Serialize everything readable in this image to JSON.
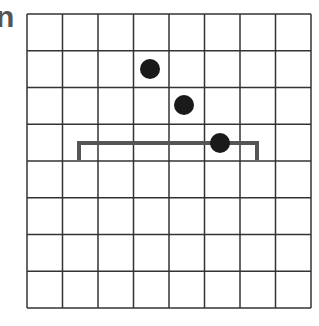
{
  "label": "n",
  "grid": {
    "rows": 8,
    "cols": 8,
    "x0": 27,
    "y0": 14,
    "x1": 311,
    "y1": 308,
    "line_color": "#333333"
  },
  "bracket": {
    "x_start": 79,
    "x_end": 257,
    "y": 143,
    "y_leg_end": 160,
    "color": "#555555"
  },
  "dots": [
    {
      "cx": 150,
      "cy": 69,
      "r": 10
    },
    {
      "cx": 184,
      "cy": 105,
      "r": 10
    },
    {
      "cx": 220,
      "cy": 143,
      "r": 10
    }
  ],
  "dot_color": "#1a1a1a"
}
